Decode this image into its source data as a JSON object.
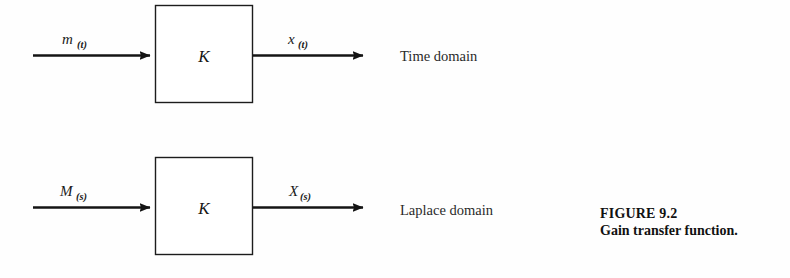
{
  "figure": {
    "caption_title": "FIGURE 9.2",
    "caption_description": "Gain transfer function.",
    "background_color": "#fefefe",
    "ink_color": "#1a1a1a"
  },
  "diagrams": [
    {
      "id": "time-domain",
      "block_label": "K",
      "input_var": "m",
      "input_subscript": "(t)",
      "output_var": "x",
      "output_subscript": "(t)",
      "domain_label": "Time domain"
    },
    {
      "id": "laplace-domain",
      "block_label": "K",
      "input_var": "M",
      "input_subscript": "(s)",
      "output_var": "X",
      "output_subscript": "(s)",
      "domain_label": "Laplace domain"
    }
  ]
}
